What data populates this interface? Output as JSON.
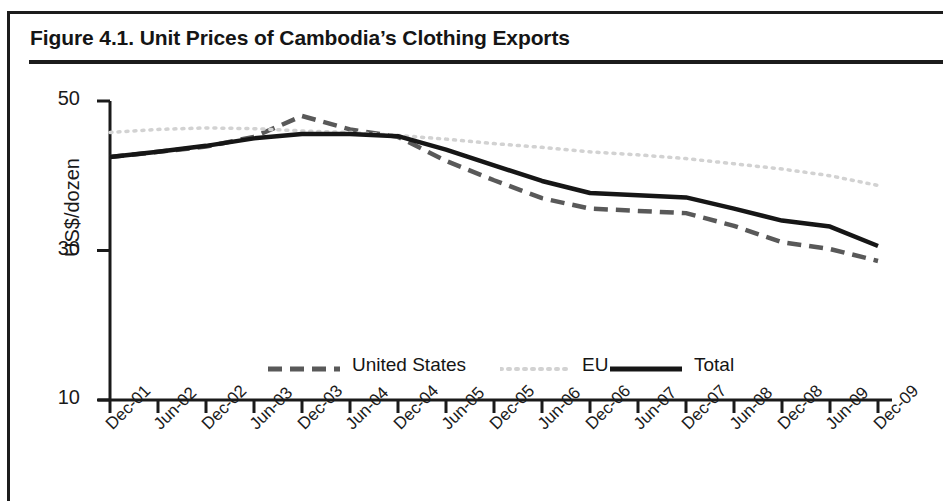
{
  "figure": {
    "title": "Figure 4.1. Unit Prices of Cambodia’s Clothing Exports"
  },
  "chart_data": {
    "type": "line",
    "title": "Figure 4.1. Unit Prices of Cambodia’s Clothing Exports",
    "xlabel": "",
    "ylabel": "US$/dozen",
    "ylim": [
      10,
      50
    ],
    "yticks": [
      10,
      30,
      50
    ],
    "ytick_labels": [
      "10",
      "30",
      "50"
    ],
    "grid": false,
    "legend_position": "inside-bottom-center",
    "x": [
      "Dec-01",
      "Jun-02",
      "Dec-02",
      "Jun-03",
      "Dec-03",
      "Jun-04",
      "Dec-04",
      "Jun-05",
      "Dec-05",
      "Jun-06",
      "Dec-06",
      "Jun-07",
      "Dec-07",
      "Jun-08",
      "Dec-08",
      "Jun-09",
      "Dec-09"
    ],
    "categories": [
      "Dec-01",
      "Jun-02",
      "Dec-02",
      "Jun-03",
      "Dec-03",
      "Jun-04",
      "Dec-04",
      "Jun-05",
      "Dec-05",
      "Jun-06",
      "Dec-06",
      "Jun-07",
      "Dec-07",
      "Jun-08",
      "Dec-08",
      "Jun-09",
      "Dec-09"
    ],
    "series": [
      {
        "name": "United States",
        "style": "dashed",
        "color": "#595959",
        "values": [
          42.5,
          43.2,
          43.9,
          45.2,
          48.0,
          46.2,
          45.2,
          42.0,
          39.4,
          37.0,
          35.6,
          35.3,
          35.0,
          33.3,
          31.1,
          30.2,
          28.6
        ]
      },
      {
        "name": "EU",
        "style": "dotted",
        "color": "#d2d2d2",
        "values": [
          45.8,
          46.2,
          46.4,
          46.3,
          46.0,
          45.8,
          45.4,
          44.9,
          44.3,
          43.8,
          43.2,
          42.8,
          42.3,
          41.6,
          40.9,
          40.0,
          38.7
        ]
      },
      {
        "name": "Total",
        "style": "solid",
        "color": "#161616",
        "values": [
          42.5,
          43.2,
          44.0,
          45.0,
          45.6,
          45.6,
          45.3,
          43.5,
          41.4,
          39.3,
          37.7,
          37.4,
          37.1,
          35.6,
          34.0,
          33.2,
          30.6
        ]
      }
    ]
  },
  "legend": {
    "items": [
      {
        "label": "United States",
        "style": "dashed",
        "color": "#595959"
      },
      {
        "label": "EU",
        "style": "dotted",
        "color": "#d2d2d2"
      },
      {
        "label": "Total",
        "style": "solid",
        "color": "#161616"
      }
    ]
  },
  "axes": {
    "y_title": "US$/dozen"
  }
}
